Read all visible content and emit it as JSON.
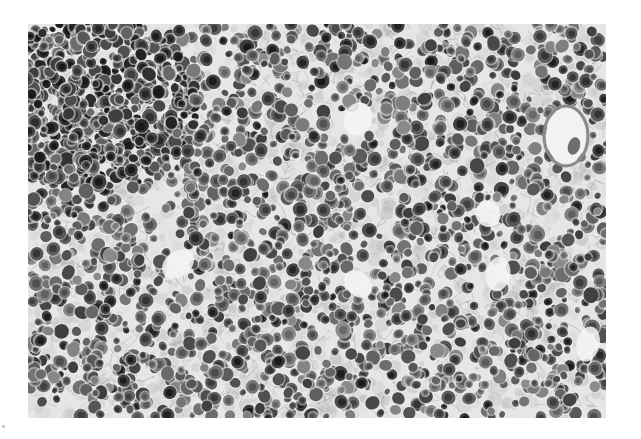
{
  "image": {
    "kind": "grayscale histology micrograph",
    "subject": "densely packed round cells with dark nuclei in fibrillar stroma",
    "panel": {
      "x": 28,
      "y": 24,
      "width": 578,
      "height": 394
    },
    "background_color": "#ffffff",
    "tones": {
      "stroma_light": "#e6e6e6",
      "stroma_mid": "#bdbdbd",
      "cell_mid": "#7a7a7a",
      "cell_dark": "#3c3c3c",
      "nucleus_darkest": "#262626"
    },
    "regions": [
      {
        "name": "dense-dark-cluster",
        "cx": 60,
        "cy": 80,
        "r": 110,
        "density": 1.8,
        "darkness": 0.35
      },
      {
        "name": "vessel-lumen",
        "cx": 538,
        "cy": 112,
        "rx": 20,
        "ry": 28
      },
      {
        "name": "pale-spaces",
        "points": [
          [
            330,
            95
          ],
          [
            460,
            190
          ],
          [
            150,
            240
          ],
          [
            330,
            260
          ],
          [
            470,
            250
          ],
          [
            560,
            320
          ]
        ]
      }
    ],
    "cell_count": 2600,
    "seed": 7
  },
  "marks": {
    "corner_dot": {
      "x": 3,
      "y": 427
    }
  }
}
